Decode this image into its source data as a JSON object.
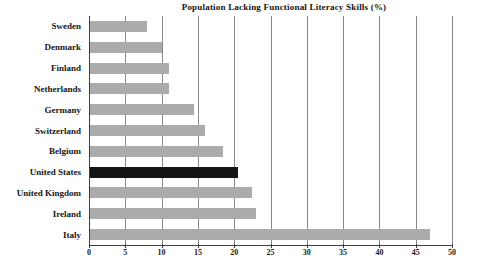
{
  "chart_data": {
    "type": "bar",
    "orientation": "horizontal",
    "title": "Population Lacking Functional Literacy Skills (%)",
    "xlabel": "",
    "ylabel": "",
    "categories": [
      "Sweden",
      "Denmark",
      "Finland",
      "Netherlands",
      "Germany",
      "Switzerland",
      "Belgium",
      "United States",
      "United Kingdom",
      "Ireland",
      "Italy"
    ],
    "values": [
      8,
      10,
      11,
      11,
      14.5,
      16,
      18.5,
      20.5,
      22.5,
      23,
      47
    ],
    "highlight_category": "United States",
    "highlight_index": 7,
    "xlim": [
      0,
      50
    ],
    "xticks": [
      0,
      5,
      10,
      15,
      20,
      25,
      30,
      35,
      40,
      45,
      50
    ],
    "xtick_labels": [
      "0",
      "5",
      "10",
      "15",
      "20",
      "25",
      "30",
      "35",
      "40",
      "45",
      "50"
    ],
    "grid": true,
    "grid_axis": "x",
    "legend": false,
    "colors": {
      "bar": "#ababab",
      "highlight_bar": "#141414",
      "gridline": "#8a8a8a",
      "axis": "#3d3d3d",
      "text": "#141414",
      "background": "#ffffff"
    }
  }
}
